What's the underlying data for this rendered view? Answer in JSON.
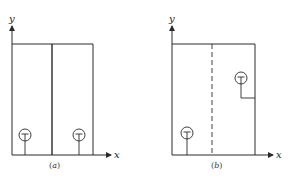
{
  "figures": [
    {
      "id": "a",
      "caption_open": "(",
      "caption_letter": "a",
      "caption_close": ")",
      "y_axis_label": "y",
      "x_axis_label": "x",
      "divider_style": "solid"
    },
    {
      "id": "b",
      "caption_open": "(",
      "caption_letter": "b",
      "caption_close": ")",
      "y_axis_label": "y",
      "x_axis_label": "x",
      "divider_style": "dashed"
    }
  ],
  "colors": {
    "line": "#2a2a2a",
    "background": "#ffffff"
  }
}
